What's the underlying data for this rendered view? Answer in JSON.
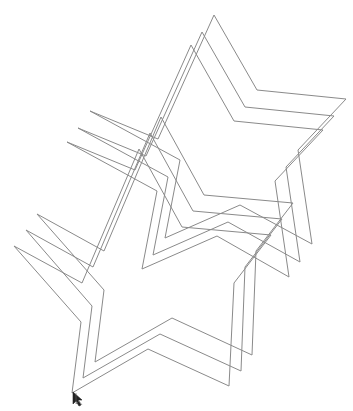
{
  "canvas": {
    "background": "#ffffff",
    "stroke_color": "#8a8a8a",
    "width": 353,
    "height": 411
  },
  "top_clipped_text": "",
  "shapes": [
    {
      "type": "star",
      "group": "upper",
      "index": 1,
      "points": [
        [
          214,
          15
        ],
        [
          257,
          90
        ],
        [
          346,
          99
        ],
        [
          298,
          150
        ],
        [
          312,
          244
        ],
        [
          240,
          205
        ],
        [
          165,
          238
        ],
        [
          180,
          160
        ],
        [
          90,
          111
        ],
        [
          158,
          139
        ]
      ]
    },
    {
      "type": "star",
      "group": "upper",
      "index": 2,
      "points": [
        [
          202,
          32
        ],
        [
          245,
          107
        ],
        [
          334,
          116
        ],
        [
          286,
          167
        ],
        [
          300,
          262
        ],
        [
          228,
          222
        ],
        [
          153,
          255
        ],
        [
          168,
          177
        ],
        [
          78,
          128
        ],
        [
          146,
          156
        ]
      ]
    },
    {
      "type": "star",
      "group": "upper",
      "index": 3,
      "points": [
        [
          191,
          45
        ],
        [
          234,
          121
        ],
        [
          323,
          130
        ],
        [
          275,
          181
        ],
        [
          289,
          277
        ],
        [
          217,
          236
        ],
        [
          142,
          269
        ],
        [
          157,
          191
        ],
        [
          67,
          142
        ],
        [
          135,
          170
        ]
      ]
    },
    {
      "type": "star",
      "group": "lower",
      "index": 1,
      "points": [
        [
          161,
          117
        ],
        [
          204,
          195
        ],
        [
          293,
          203
        ],
        [
          256,
          251
        ],
        [
          252,
          355
        ],
        [
          172,
          318
        ],
        [
          95,
          362
        ],
        [
          104,
          290
        ],
        [
          37,
          214
        ],
        [
          104,
          251
        ]
      ]
    },
    {
      "type": "star",
      "group": "lower",
      "index": 2,
      "points": [
        [
          150,
          133
        ],
        [
          193,
          211
        ],
        [
          282,
          219
        ],
        [
          245,
          267
        ],
        [
          241,
          371
        ],
        [
          160,
          334
        ],
        [
          83,
          378
        ],
        [
          92,
          306
        ],
        [
          26,
          230
        ],
        [
          93,
          267
        ]
      ]
    },
    {
      "type": "star",
      "group": "lower",
      "index": 3,
      "points": [
        [
          139,
          149
        ],
        [
          182,
          227
        ],
        [
          271,
          235
        ],
        [
          234,
          283
        ],
        [
          229,
          386
        ],
        [
          148,
          349
        ],
        [
          72,
          393
        ],
        [
          81,
          322
        ],
        [
          14,
          246
        ],
        [
          82,
          283
        ]
      ]
    }
  ],
  "cursor": {
    "icon": "arrow-cursor-icon",
    "x": 72,
    "y": 391
  }
}
